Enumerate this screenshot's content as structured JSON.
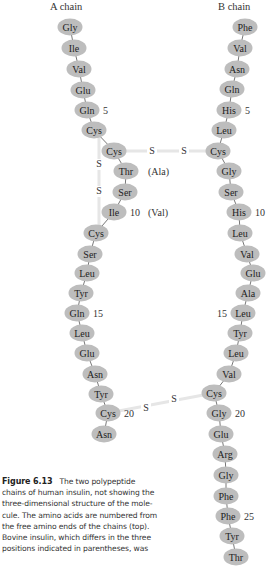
{
  "diagram": {
    "a_chain_title": "A chain",
    "b_chain_title": "B chain",
    "ellipse_color": "#bdbdbd",
    "bridge_color": "#e6e6e6",
    "a_chain": [
      {
        "name": "Gly",
        "x": 70,
        "y": 27
      },
      {
        "name": "Ile",
        "x": 74,
        "y": 48
      },
      {
        "name": "Val",
        "x": 79,
        "y": 69
      },
      {
        "name": "Glu",
        "x": 83,
        "y": 90
      },
      {
        "name": "Gln",
        "x": 87,
        "y": 110,
        "num": "5"
      },
      {
        "name": "Cys",
        "x": 94,
        "y": 130
      },
      {
        "name": "Cys",
        "x": 114,
        "y": 151
      },
      {
        "name": "Thr",
        "x": 126,
        "y": 171,
        "alt": "(Ala)"
      },
      {
        "name": "Ser",
        "x": 125,
        "y": 192
      },
      {
        "name": "Ile",
        "x": 114,
        "y": 212,
        "num": "10",
        "alt": "(Val)"
      },
      {
        "name": "Cys",
        "x": 96,
        "y": 233
      },
      {
        "name": "Ser",
        "x": 90,
        "y": 254
      },
      {
        "name": "Leu",
        "x": 87,
        "y": 273
      },
      {
        "name": "Tyr",
        "x": 81,
        "y": 293
      },
      {
        "name": "Gln",
        "x": 77,
        "y": 313,
        "num": "15"
      },
      {
        "name": "Leu",
        "x": 82,
        "y": 333
      },
      {
        "name": "Glu",
        "x": 87,
        "y": 353
      },
      {
        "name": "Asn",
        "x": 95,
        "y": 374
      },
      {
        "name": "Tyr",
        "x": 101,
        "y": 394
      },
      {
        "name": "Cys",
        "x": 108,
        "y": 413,
        "num": "20"
      },
      {
        "name": "Asn",
        "x": 104,
        "y": 434
      }
    ],
    "b_chain": [
      {
        "name": "Phe",
        "x": 245,
        "y": 27
      },
      {
        "name": "Val",
        "x": 240,
        "y": 48
      },
      {
        "name": "Asn",
        "x": 237,
        "y": 69
      },
      {
        "name": "Gln",
        "x": 232,
        "y": 89
      },
      {
        "name": "His",
        "x": 229,
        "y": 110,
        "num": "5"
      },
      {
        "name": "Leu",
        "x": 224,
        "y": 130
      },
      {
        "name": "Cys",
        "x": 218,
        "y": 151
      },
      {
        "name": "Gly",
        "x": 229,
        "y": 171
      },
      {
        "name": "Ser",
        "x": 231,
        "y": 192
      },
      {
        "name": "His",
        "x": 239,
        "y": 212,
        "num": "10"
      },
      {
        "name": "Leu",
        "x": 240,
        "y": 233
      },
      {
        "name": "Val",
        "x": 247,
        "y": 254
      },
      {
        "name": "Glu",
        "x": 253,
        "y": 273
      },
      {
        "name": "Ala",
        "x": 248,
        "y": 293
      },
      {
        "name": "Leu",
        "x": 243,
        "y": 313,
        "num": "15",
        "num_left": true
      },
      {
        "name": "Tyr",
        "x": 240,
        "y": 333
      },
      {
        "name": "Leu",
        "x": 236,
        "y": 353
      },
      {
        "name": "Val",
        "x": 229,
        "y": 374
      },
      {
        "name": "Cys",
        "x": 214,
        "y": 393
      },
      {
        "name": "Gly",
        "x": 219,
        "y": 413,
        "num": "20"
      },
      {
        "name": "Glu",
        "x": 221,
        "y": 434
      },
      {
        "name": "Arg",
        "x": 225,
        "y": 454
      },
      {
        "name": "Gly",
        "x": 226,
        "y": 475
      },
      {
        "name": "Phe",
        "x": 226,
        "y": 496
      },
      {
        "name": "Phe",
        "x": 228,
        "y": 516,
        "num": "25"
      },
      {
        "name": "Tyr",
        "x": 232,
        "y": 536
      },
      {
        "name": "Thr",
        "x": 236,
        "y": 557
      }
    ],
    "disulfide_bonds": [
      {
        "label": "S",
        "x": 152,
        "y": 154
      },
      {
        "label": "S",
        "x": 184,
        "y": 154
      },
      {
        "label": "S",
        "x": 99,
        "y": 167
      },
      {
        "label": "S",
        "x": 99,
        "y": 194
      },
      {
        "label": "S",
        "x": 146,
        "y": 411
      },
      {
        "label": "S",
        "x": 174,
        "y": 402
      }
    ]
  },
  "caption": {
    "figure_label": "Figure 6.13",
    "text": "The two polypeptide chains of human insulin, not showing the three-dimensional structure of the molecule. The amino acids are numbered from the free amino ends of the chains (top). Bovine insulin, which differs in the three positions indicated in parentheses, was",
    "lines": [
      "chains of human insulin, not showing the",
      "three-dimensional structure of the mole-",
      "cule. The amino acids are numbered from",
      "the free amino ends of the chains (top).",
      "Bovine insulin, which differs in the three",
      "positions indicated in parentheses, was"
    ],
    "first_line_rest": "The two polypeptide"
  }
}
